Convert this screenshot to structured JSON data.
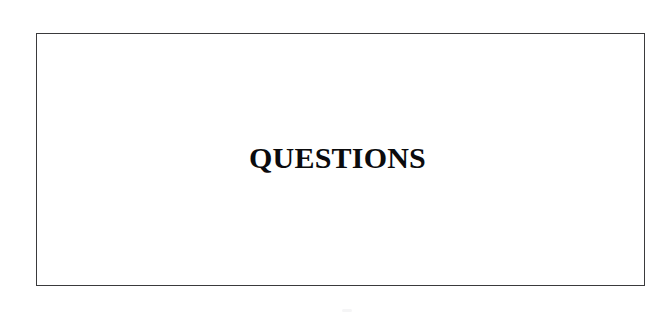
{
  "page": {
    "background_color": "#ffffff",
    "width": 670,
    "height": 318
  },
  "slide": {
    "frame": {
      "border_color": "#3a3a3c",
      "border_width_px": 1,
      "background_color": "#ffffff"
    },
    "title": "QUESTIONS",
    "title_color": "#0b0b0d",
    "title_style": "bold-serif",
    "title_align": "center"
  },
  "artifacts": {
    "speckle_color": "#f4f4f5"
  }
}
